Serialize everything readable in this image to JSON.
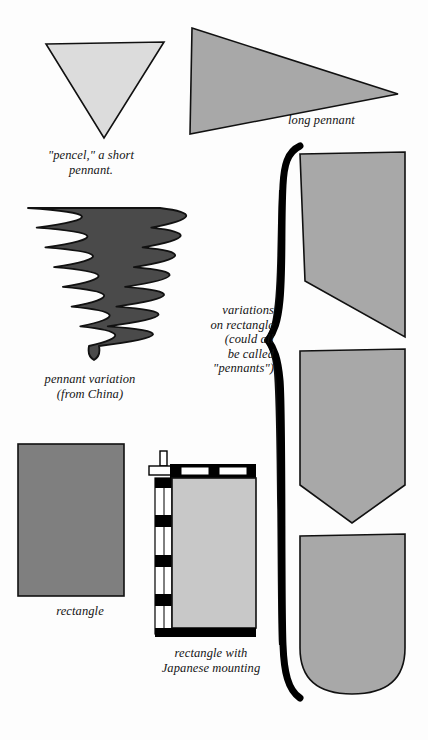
{
  "page": {
    "background_color": "#fdfdfd",
    "width": 428,
    "height": 740
  },
  "palette": {
    "light_gray": "#dcdcdc",
    "medium_gray": "#a8a8a8",
    "mid_gray": "#7f7f7f",
    "dark_gray": "#4a4a4a",
    "outline": "#111111",
    "black": "#000000",
    "white": "#ffffff"
  },
  "captions": {
    "pencel": "\"pencel,\" a short\npennant.",
    "long_pennant": "long pennant",
    "china_pennant": "pennant variation\n(from China)",
    "rectangle": "rectangle",
    "japanese_mounting": "rectangle with\nJapanese mounting",
    "variations_brace": "variations\non rectangle\n(could all\nbe called\n\"pennants\")"
  },
  "figures": [
    {
      "name": "pencel-triangle",
      "label": "\"pencel,\" a short pennant.",
      "shape": "inverted-triangle",
      "fill": "#dcdcdc",
      "x": 44,
      "y": 42,
      "width": 120,
      "height": 94
    },
    {
      "name": "long-pennant",
      "label": "long pennant",
      "shape": "right-pointing-triangle",
      "fill": "#a8a8a8",
      "x": 190,
      "y": 26,
      "width": 210,
      "height": 108
    },
    {
      "name": "china-pennant",
      "label": "pennant variation (from China)",
      "shape": "flame-edged-triangle",
      "fill": "#4a4a4a",
      "x": 28,
      "y": 208,
      "width": 132,
      "height": 152
    },
    {
      "name": "plain-rectangle",
      "label": "rectangle",
      "shape": "rectangle",
      "fill": "#7f7f7f",
      "x": 17,
      "y": 443,
      "width": 108,
      "height": 154
    },
    {
      "name": "japanese-mounting",
      "label": "rectangle with Japanese mounting",
      "shape": "rectangle-with-mount",
      "fill": "#c8c8c8",
      "accents": [
        "#000000",
        "#ffffff"
      ],
      "x": 148,
      "y": 450,
      "width": 108,
      "height": 188
    },
    {
      "name": "variation-swallow-slant",
      "label": "variation on rectangle: slanted tail",
      "shape": "slant-cut-rectangle",
      "fill": "#a8a8a8",
      "x": 299,
      "y": 153,
      "width": 108,
      "height": 184
    },
    {
      "name": "variation-pointed",
      "label": "variation on rectangle: pointed tail",
      "shape": "pointed-bottom-rectangle",
      "fill": "#a8a8a8",
      "x": 299,
      "y": 350,
      "width": 108,
      "height": 173
    },
    {
      "name": "variation-rounded",
      "label": "variation on rectangle: rounded tail",
      "shape": "rounded-bottom-rectangle",
      "fill": "#a8a8a8",
      "x": 299,
      "y": 535,
      "width": 108,
      "height": 160
    }
  ],
  "brace": {
    "name": "variations-brace",
    "orientation": "left-facing",
    "top": 145,
    "bottom": 700,
    "midpoint": 340,
    "color": "#000000"
  }
}
